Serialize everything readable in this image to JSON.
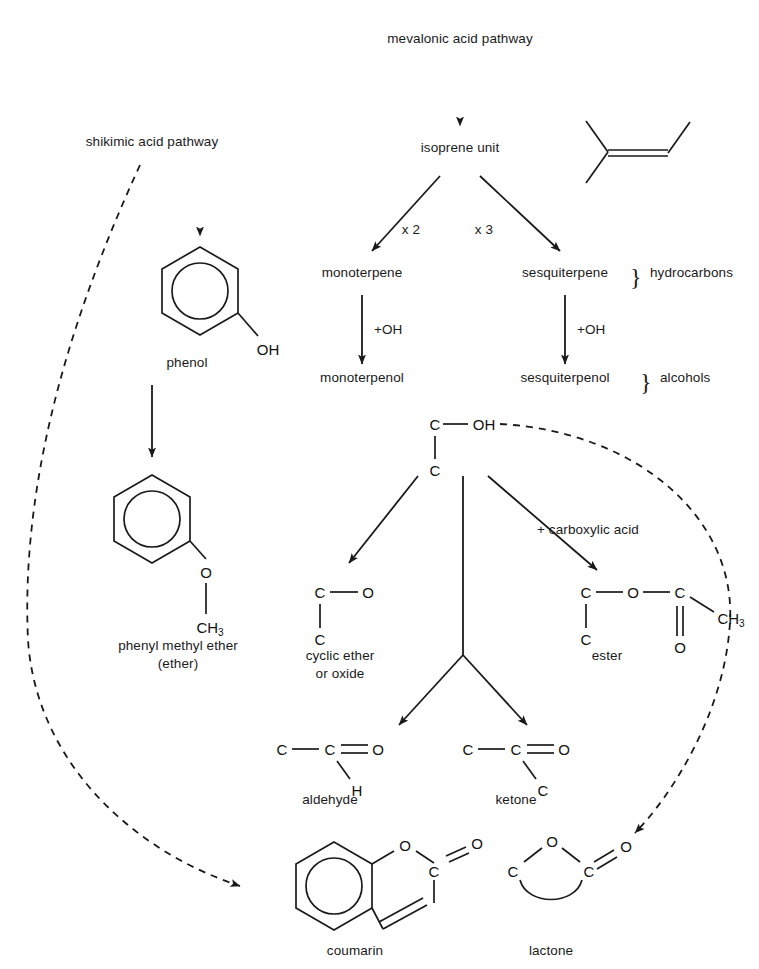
{
  "diagram": {
    "type": "flow-diagram",
    "line_color": "#1a1a1a",
    "background": "#ffffff"
  },
  "pathways": {
    "mevalonic": "mevalonic acid pathway",
    "shikimic": "shikimic acid pathway",
    "isoprene": "isoprene unit"
  },
  "terpenes": {
    "multiplier_two": "x 2",
    "multiplier_three": "x 3",
    "monoterpene": "monoterpene",
    "sesquiterpene": "sesquiterpene",
    "monoterpenol": "monoterpenol",
    "sesquiterpenol": "sesquiterpenol",
    "oh_left": "+OH",
    "oh_right": "+OH",
    "brace_hydrocarbons": "hydrocarbons",
    "brace_alcohols": "alcohols",
    "brace_glyph": "}"
  },
  "reactions": {
    "carboxylic": "+ carboxylic acid"
  },
  "compounds": {
    "phenol": "phenol",
    "phenyl_methyl_ether": "phenyl methyl ether",
    "phenyl_methyl_ether_sub": "(ether)",
    "cyclic_ether_line1": "cyclic ether",
    "cyclic_ether_line2": "or oxide",
    "ester": "ester",
    "aldehyde": "aldehyde",
    "ketone": "ketone",
    "coumarin": "coumarin",
    "lactone": "lactone"
  },
  "atoms": {
    "phenol_oh": "OH",
    "ether_o": "O",
    "ether_ch3": "CH3",
    "hub_c_top": "C",
    "hub_oh": "OH",
    "hub_c_bottom": "C",
    "cyclic_c_top": "C",
    "cyclic_o": "O",
    "cyclic_c_bottom": "C",
    "ester_c1": "C",
    "ester_o_bridge": "O",
    "ester_c2": "C",
    "ester_ch3": "CH3",
    "ester_o_double": "O",
    "ester_c_below": "C",
    "aldehyde_c1": "C",
    "aldehyde_c2": "C",
    "aldehyde_o": "O",
    "aldehyde_h": "H",
    "ketone_c1": "C",
    "ketone_c2": "C",
    "ketone_o": "O",
    "ketone_c3": "C",
    "coumarin_o_ring": "O",
    "coumarin_c": "C",
    "coumarin_o_double": "O",
    "lactone_o_ring": "O",
    "lactone_c_left": "C",
    "lactone_c_right": "C",
    "lactone_o_double": "O"
  }
}
